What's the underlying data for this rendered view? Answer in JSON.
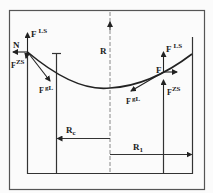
{
  "diagram": {
    "labels": {
      "N": "N",
      "F_LS_left": "F",
      "F_LS_left_sup": "LS",
      "F_ZS_left": "F",
      "F_ZS_left_sup": "ZS",
      "F_gL_left": "F",
      "F_gL_left_sup": "gL",
      "R": "R",
      "F_right": "F",
      "F_LS_right": "F",
      "F_LS_right_sup": "LS",
      "F_ZS_right": "F",
      "F_ZS_right_sup": "ZS",
      "F_gL_right": "F",
      "F_gL_right_sup": "gL",
      "Rc": "R",
      "Rc_sub": "c",
      "R1": "R",
      "R1_sub": "1"
    },
    "colors": {
      "line": "#222222",
      "background": "#fbfbfb",
      "dashed": "#999999"
    }
  }
}
